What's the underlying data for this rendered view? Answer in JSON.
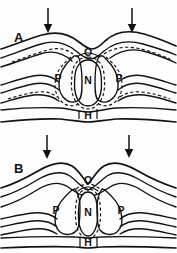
{
  "figure": {
    "background_color": "#fdfdfd",
    "line_color": "#111111",
    "panels": [
      {
        "id": "A",
        "label": "A",
        "label_x": 14,
        "label_y": 42,
        "description": "Normal configuration: smooth arched dorsal contour, rounded central nucleus",
        "regions": [
          {
            "label": "O",
            "x": 88,
            "y": 52,
            "name": "region-o"
          },
          {
            "label": "P",
            "x": 58,
            "y": 78,
            "name": "region-p-left"
          },
          {
            "label": "N",
            "x": 88,
            "y": 80,
            "name": "region-n"
          },
          {
            "label": "P",
            "x": 119,
            "y": 78,
            "name": "region-p-right"
          },
          {
            "label": "H",
            "x": 88,
            "y": 113,
            "name": "region-h"
          }
        ],
        "arrows": [
          {
            "x": 48,
            "y_start": 7,
            "y_end": 31,
            "name": "force-arrow-left"
          },
          {
            "x": 132,
            "y_start": 7,
            "y_end": 31,
            "name": "force-arrow-right"
          }
        ]
      },
      {
        "id": "B",
        "label": "B",
        "label_x": 14,
        "label_y": 173,
        "description": "Compressed configuration: V-shaped dorsal notch, narrowed central nucleus",
        "regions": [
          {
            "label": "O",
            "x": 88,
            "y": 180,
            "name": "region-o"
          },
          {
            "label": "P",
            "x": 56,
            "y": 208,
            "name": "region-p-left"
          },
          {
            "label": "N",
            "x": 88,
            "y": 210,
            "name": "region-n"
          },
          {
            "label": "P",
            "x": 121,
            "y": 208,
            "name": "region-p-right"
          },
          {
            "label": "H",
            "x": 88,
            "y": 240,
            "name": "region-h"
          }
        ],
        "arrows": [
          {
            "x": 47,
            "y_start": 134,
            "y_end": 158,
            "name": "force-arrow-left"
          },
          {
            "x": 129,
            "y_start": 134,
            "y_end": 157,
            "name": "force-arrow-right"
          }
        ]
      }
    ]
  }
}
